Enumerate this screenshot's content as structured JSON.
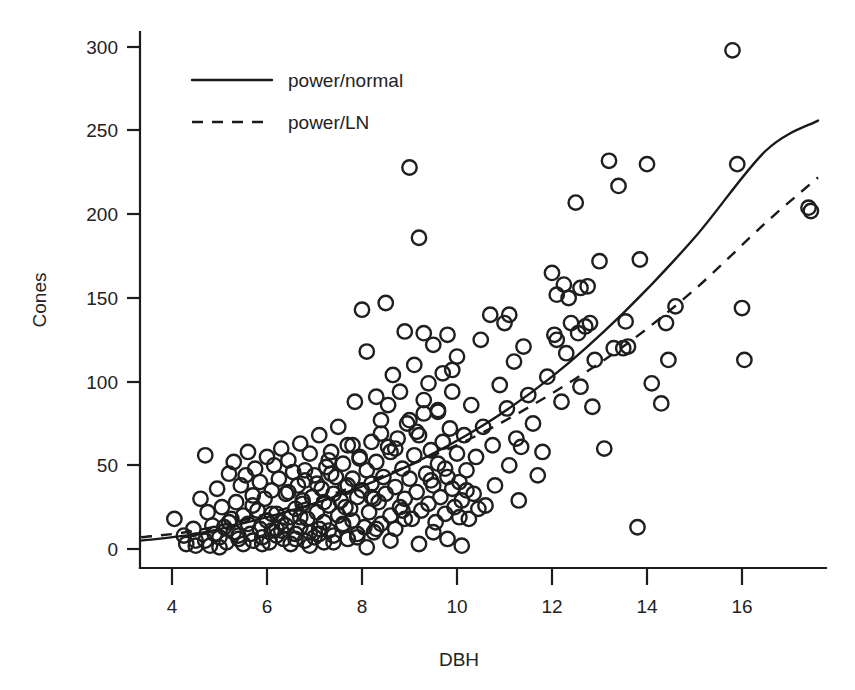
{
  "chart_data": {
    "type": "scatter",
    "title": "",
    "xlabel": "DBH",
    "ylabel": "Cones",
    "xlim": [
      3.35,
      17.75
    ],
    "ylim": [
      -12,
      312
    ],
    "xticks": [
      4,
      6,
      8,
      10,
      12,
      14,
      16
    ],
    "yticks": [
      0,
      50,
      100,
      150,
      200,
      250,
      300
    ],
    "grid": false,
    "legend_position": "top-left-inside",
    "marker": "open-circle",
    "legend": [
      {
        "label": "power/normal",
        "style": "solid"
      },
      {
        "label": "power/LN",
        "style": "dashed"
      }
    ],
    "series": [
      {
        "name": "observations",
        "type": "scatter",
        "x": [
          4.05,
          4.25,
          4.3,
          4.45,
          4.5,
          4.6,
          4.7,
          4.75,
          4.8,
          4.85,
          4.9,
          4.95,
          5.0,
          5.05,
          5.1,
          5.15,
          5.2,
          5.25,
          5.3,
          5.3,
          5.35,
          5.4,
          5.45,
          5.5,
          5.5,
          5.55,
          5.6,
          5.6,
          5.65,
          5.7,
          5.7,
          5.75,
          5.8,
          5.85,
          5.85,
          5.9,
          5.95,
          6.0,
          6.0,
          6.05,
          6.1,
          6.1,
          6.15,
          6.2,
          6.2,
          6.25,
          6.3,
          6.3,
          6.35,
          6.4,
          6.4,
          6.45,
          6.5,
          6.5,
          6.55,
          6.6,
          6.6,
          6.65,
          6.7,
          6.7,
          6.75,
          6.8,
          6.8,
          6.85,
          6.9,
          6.9,
          6.95,
          7.0,
          7.0,
          7.05,
          7.1,
          7.1,
          7.15,
          7.2,
          7.2,
          7.25,
          7.3,
          7.3,
          7.35,
          7.4,
          7.4,
          7.45,
          7.5,
          7.5,
          7.55,
          7.6,
          7.6,
          7.65,
          7.7,
          7.7,
          7.75,
          7.8,
          7.8,
          7.85,
          7.9,
          7.9,
          7.95,
          8.0,
          8.0,
          8.05,
          8.1,
          8.1,
          8.15,
          8.2,
          8.2,
          8.25,
          8.3,
          8.3,
          8.35,
          8.4,
          8.4,
          8.45,
          8.5,
          8.5,
          8.55,
          8.6,
          8.6,
          8.65,
          8.7,
          8.7,
          8.75,
          8.8,
          8.8,
          8.85,
          8.9,
          8.9,
          8.95,
          9.0,
          9.0,
          9.05,
          9.1,
          9.1,
          9.15,
          9.2,
          9.2,
          9.25,
          9.3,
          9.3,
          9.35,
          9.4,
          9.4,
          9.45,
          9.5,
          9.5,
          9.55,
          9.6,
          9.6,
          9.65,
          9.7,
          9.7,
          9.75,
          9.8,
          9.8,
          9.85,
          9.9,
          9.9,
          9.95,
          10.0,
          10.0,
          10.05,
          10.1,
          10.15,
          10.2,
          10.25,
          10.3,
          10.35,
          10.4,
          10.5,
          10.55,
          10.6,
          10.7,
          10.75,
          10.8,
          10.9,
          11.0,
          11.05,
          11.1,
          11.2,
          11.25,
          11.3,
          11.4,
          11.5,
          11.6,
          11.7,
          11.8,
          11.9,
          12.0,
          12.05,
          12.1,
          12.2,
          12.25,
          12.3,
          12.4,
          12.5,
          12.55,
          12.6,
          12.7,
          12.8,
          12.85,
          12.9,
          13.0,
          13.1,
          13.2,
          13.4,
          13.5,
          13.55,
          13.8,
          13.85,
          14.0,
          14.1,
          14.3,
          14.4,
          14.45,
          14.6,
          15.8,
          15.9,
          16.0,
          16.05,
          17.4,
          17.45,
          4.5,
          4.7,
          5.0,
          5.4,
          5.9,
          6.3,
          6.6,
          6.9,
          7.1,
          7.4,
          7.6,
          7.9,
          8.1,
          8.3,
          8.6,
          8.9,
          9.2,
          9.5,
          9.8,
          10.1,
          5.2,
          5.7,
          6.1,
          6.45,
          6.75,
          7.05,
          7.35,
          7.65,
          7.95,
          8.25,
          8.55,
          8.85,
          9.15,
          9.45,
          9.75,
          10.05,
          6.2,
          6.8,
          7.3,
          7.8,
          8.4,
          9.0,
          9.6,
          10.2,
          11.1,
          12.1,
          12.6,
          13.3,
          6.7,
          7.2,
          7.7,
          8.2,
          8.7,
          9.3,
          9.9,
          10.45,
          11.35,
          12.35,
          12.75,
          13.6
        ],
        "y": [
          18,
          8,
          3,
          12,
          5,
          30,
          56,
          22,
          2,
          14,
          9,
          36,
          7,
          25,
          13,
          4,
          45,
          18,
          52,
          10,
          28,
          6,
          38,
          20,
          3,
          44,
          15,
          58,
          9,
          32,
          5,
          48,
          23,
          12,
          40,
          7,
          30,
          17,
          55,
          4,
          35,
          11,
          50,
          21,
          8,
          42,
          16,
          60,
          6,
          33,
          14,
          53,
          19,
          3,
          46,
          24,
          9,
          38,
          13,
          63,
          27,
          5,
          41,
          18,
          10,
          57,
          31,
          7,
          44,
          22,
          12,
          68,
          36,
          16,
          4,
          49,
          26,
          11,
          58,
          33,
          8,
          43,
          20,
          73,
          29,
          14,
          51,
          37,
          6,
          62,
          24,
          42,
          17,
          88,
          31,
          9,
          55,
          143,
          35,
          13,
          47,
          118,
          22,
          64,
          39,
          10,
          91,
          52,
          28,
          77,
          15,
          43,
          147,
          33,
          86,
          58,
          20,
          104,
          37,
          12,
          66,
          94,
          25,
          48,
          130,
          30,
          75,
          228,
          42,
          18,
          110,
          56,
          34,
          186,
          68,
          23,
          89,
          129,
          45,
          99,
          27,
          59,
          122,
          38,
          16,
          82,
          51,
          31,
          105,
          64,
          21,
          128,
          43,
          72,
          36,
          94,
          25,
          57,
          115,
          40,
          29,
          68,
          47,
          18,
          86,
          33,
          55,
          125,
          73,
          26,
          140,
          62,
          38,
          98,
          135,
          84,
          50,
          112,
          66,
          29,
          121,
          92,
          75,
          44,
          58,
          103,
          165,
          128,
          152,
          88,
          158,
          117,
          135,
          207,
          129,
          97,
          133,
          135,
          85,
          113,
          172,
          60,
          232,
          217,
          120,
          136,
          13,
          173,
          230,
          99,
          87,
          135,
          113,
          145,
          298,
          230,
          144,
          113,
          204,
          202,
          2,
          5,
          1,
          8,
          3,
          11,
          6,
          2,
          9,
          4,
          15,
          7,
          1,
          12,
          5,
          18,
          3,
          10,
          6,
          2,
          16,
          26,
          21,
          34,
          29,
          39,
          45,
          25,
          54,
          30,
          61,
          23,
          70,
          41,
          48,
          19,
          12,
          47,
          53,
          62,
          69,
          77,
          83,
          35,
          140,
          125,
          156,
          120,
          19,
          28,
          38,
          31,
          60,
          81,
          107,
          24,
          61,
          150,
          157,
          121
        ]
      },
      {
        "name": "power/normal",
        "type": "line",
        "style": "solid",
        "fit": {
          "a": 0.42,
          "b": 1.95,
          "note": "cones = a * DBH^b"
        },
        "x": [
          3.35,
          4.5,
          6.0,
          7.5,
          9.0,
          10.5,
          12.0,
          13.5,
          15.0,
          16.5,
          17.6
        ],
        "y": [
          5,
          9,
          19,
          32,
          50,
          73,
          103,
          141,
          186,
          238,
          256
        ]
      },
      {
        "name": "power/LN",
        "type": "line",
        "style": "dashed",
        "fit": {
          "a": 0.5,
          "b": 1.8,
          "note": "cones = a * DBH^b, lognormal errors"
        },
        "x": [
          3.35,
          4.5,
          6.0,
          7.5,
          9.0,
          10.5,
          12.0,
          13.5,
          15.0,
          16.5,
          17.6
        ],
        "y": [
          7,
          11,
          21,
          34,
          50,
          69,
          93,
          121,
          155,
          195,
          222
        ]
      }
    ]
  },
  "axes": {
    "x": {
      "label": "DBH",
      "ticks": [
        "4",
        "6",
        "8",
        "10",
        "12",
        "14",
        "16"
      ]
    },
    "y": {
      "label": "Cones",
      "ticks": [
        "0",
        "50",
        "100",
        "150",
        "200",
        "250",
        "300"
      ]
    }
  },
  "legend": {
    "entries": [
      {
        "label": "power/normal"
      },
      {
        "label": "power/LN"
      }
    ]
  },
  "colors": {
    "ink": "#1a1a1a",
    "background": "#ffffff",
    "marker_stroke": "#1f1f1f"
  }
}
